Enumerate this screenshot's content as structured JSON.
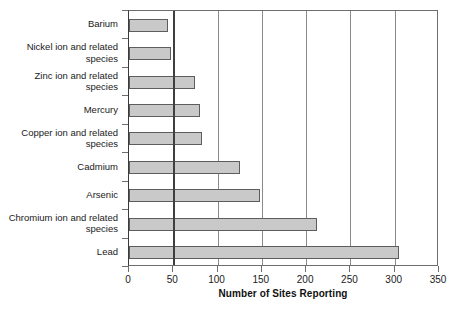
{
  "chart_data": {
    "type": "bar",
    "orientation": "horizontal",
    "title": "",
    "xlabel": "Number of Sites Reporting",
    "ylabel": "",
    "xlim": [
      0,
      350
    ],
    "xticks": [
      0,
      50,
      100,
      150,
      200,
      250,
      300,
      350
    ],
    "grid": true,
    "legend": null,
    "categories": [
      "Barium",
      "Nickel ion and related species",
      "Zinc ion and related species",
      "Mercury",
      "Copper ion and related species",
      "Cadmium",
      "Arsenic",
      "Chromium ion and related species",
      "Lead"
    ],
    "values": [
      44,
      47,
      74,
      80,
      82,
      125,
      148,
      212,
      305
    ],
    "bar_color": "#c9c9c9",
    "bar_edge_color": "#5d5d5d"
  },
  "axes": {
    "x_tick_labels": [
      "0",
      "50",
      "100",
      "150",
      "200",
      "250",
      "300",
      "350"
    ],
    "x_title": "Number of Sites Reporting",
    "category_labels": [
      "Barium",
      "Nickel ion and related species",
      "Zinc ion and related species",
      "Mercury",
      "Copper ion and related species",
      "Cadmium",
      "Arsenic",
      "Chromium ion and related species",
      "Lead"
    ]
  }
}
